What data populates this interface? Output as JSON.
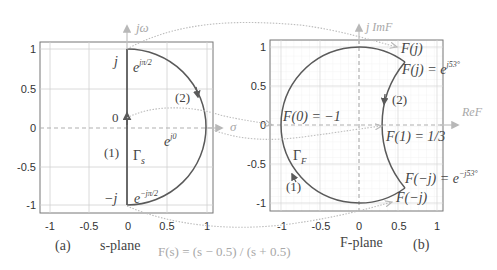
{
  "figure": {
    "formula": "F(s) = (s − 0.5) / (s + 0.5)",
    "colors": {
      "contour": "#5a5a5a",
      "grid": "#d0d0d0",
      "axis_dash": "#b0b0b0",
      "mapping_arrow": "#bdbdbd",
      "text": "#444444",
      "light_text": "#a8a8a8"
    }
  },
  "left_panel": {
    "panel_label": "(a)",
    "plane_label": "s-plane",
    "axis_imag": "jω",
    "axis_real": "σ",
    "x_ticks": [
      "-1",
      "-0.5",
      "0",
      "0.5",
      "1"
    ],
    "y_ticks": [
      "1",
      "0.5",
      "0",
      "-0.5",
      "-1"
    ],
    "labels": {
      "j": "j",
      "minus_j": "−j",
      "zero": "0",
      "e_top": "e",
      "e_top_exp": "jπ/2",
      "e_mid": "e",
      "e_mid_exp": "j0",
      "e_bot": "e",
      "e_bot_exp": "−jπ/2",
      "seg1": "(1)",
      "seg2": "(2)",
      "gamma": "Γ",
      "gamma_sub": "s"
    }
  },
  "right_panel": {
    "panel_label": "(b)",
    "plane_label": "F-plane",
    "axis_imag": "j ImF",
    "axis_real": "ReF",
    "x_ticks": [
      "-1",
      "-0.5",
      "0",
      "0.5",
      "1"
    ],
    "y_ticks": [
      "1",
      "0.5",
      "0",
      "-0.5",
      "-1"
    ],
    "labels": {
      "Fj_arrow": "F(j)",
      "Fj_eq": "F(j) = e",
      "Fj_exp": "j53°",
      "F0": "F(0) = −1",
      "F1": "F(1) = 1/3",
      "Fmj_eq": "F(−j) = e",
      "Fmj_exp": "−j53°",
      "Fmj_arrow": "F(−j)",
      "seg1": "(1)",
      "seg2": "(2)",
      "gamma": "Γ",
      "gamma_sub": "F"
    }
  }
}
